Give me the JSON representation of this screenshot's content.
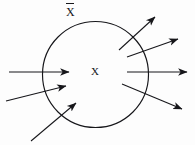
{
  "figure": {
    "background_color": "#fdfdfd",
    "ink_color": "#16161a",
    "labels": {
      "outer_region": "X",
      "outer_region_accent": "overbar",
      "inner_region": "X"
    },
    "boundary": {
      "shape": "circle",
      "center_x": 95.5,
      "center_y": 74.5,
      "radius": 53.0,
      "stroke_width": 1.15
    },
    "arrows": [
      {
        "id": "inflow-upper-left",
        "direction": "inward",
        "side": "left",
        "x1": 9,
        "y1": 72,
        "x2": 69,
        "y2": 72
      },
      {
        "id": "inflow-middle-left",
        "direction": "inward",
        "side": "left",
        "x1": 6,
        "y1": 101,
        "x2": 66,
        "y2": 86
      },
      {
        "id": "inflow-lower-left",
        "direction": "inward",
        "side": "left",
        "x1": 31,
        "y1": 141,
        "x2": 76,
        "y2": 103
      },
      {
        "id": "outflow-upper-right",
        "direction": "outward",
        "side": "right",
        "x1": 119,
        "y1": 50,
        "x2": 155,
        "y2": 17
      },
      {
        "id": "outflow-upper-mid-right",
        "direction": "outward",
        "side": "right",
        "x1": 127,
        "y1": 57,
        "x2": 178,
        "y2": 39
      },
      {
        "id": "outflow-middle-right",
        "direction": "outward",
        "side": "right",
        "x1": 127,
        "y1": 72,
        "x2": 187,
        "y2": 72
      },
      {
        "id": "outflow-lower-right",
        "direction": "outward",
        "side": "right",
        "x1": 122,
        "y1": 84,
        "x2": 182,
        "y2": 109
      }
    ]
  }
}
